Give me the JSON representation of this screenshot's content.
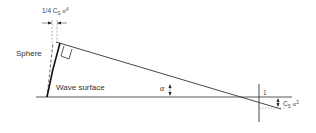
{
  "diagram": {
    "labels": {
      "top_dimension": "1/4 C",
      "top_dimension_sub": "S",
      "top_dimension_alpha": "α",
      "top_dimension_exp": "4",
      "sphere": "Sphere",
      "wave_surface": "Wave surface",
      "angle": "α",
      "marker_one": "1",
      "right_dimension": "C",
      "right_dimension_sub": "S",
      "right_dimension_alpha": "α",
      "right_dimension_exp": "3"
    },
    "colors": {
      "line": "#222222",
      "thin_line": "#555555",
      "text": "#333333"
    }
  }
}
